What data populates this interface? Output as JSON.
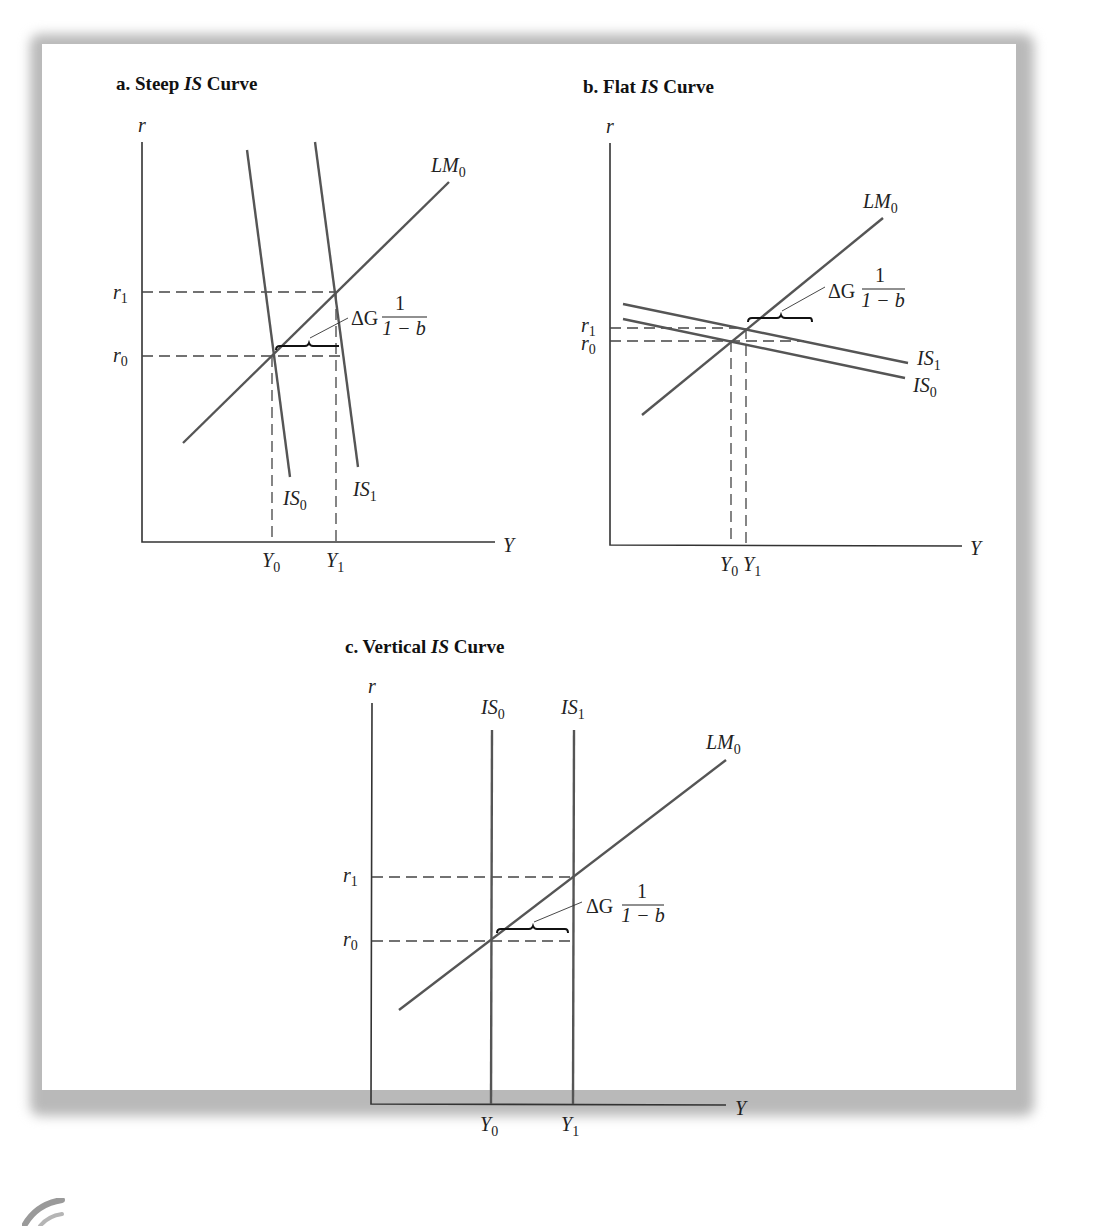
{
  "figure": {
    "panels": [
      {
        "id": "a",
        "title_prefix": "a.  Steep ",
        "title_italic": "IS",
        "title_suffix": " Curve",
        "y_axis_label": "r",
        "x_axis_label": "Y",
        "curves": {
          "lm0": "LM",
          "is0": "IS",
          "is1": "IS",
          "sub0": "0",
          "sub1": "1"
        },
        "ticks": {
          "r1": "r",
          "r0": "r",
          "y0": "Y",
          "y1": "Y",
          "sub0": "0",
          "sub1": "1"
        },
        "annotation": {
          "delta_g": "ΔG",
          "numerator": "1",
          "denominator": "1 − b"
        }
      },
      {
        "id": "b",
        "title_prefix": "b.  Flat ",
        "title_italic": "IS",
        "title_suffix": " Curve",
        "y_axis_label": "r",
        "x_axis_label": "Y",
        "curves": {
          "lm0": "LM",
          "is0": "IS",
          "is1": "IS",
          "sub0": "0",
          "sub1": "1"
        },
        "ticks": {
          "r1": "r",
          "r0": "r",
          "y0": "Y",
          "y1": "Y",
          "sub0": "0",
          "sub1": "1"
        },
        "annotation": {
          "delta_g": "ΔG",
          "numerator": "1",
          "denominator": "1 − b"
        }
      },
      {
        "id": "c",
        "title_prefix": "c.  Vertical ",
        "title_italic": "IS",
        "title_suffix": " Curve",
        "y_axis_label": "r",
        "x_axis_label": "Y",
        "curves": {
          "lm0": "LM",
          "is0": "IS",
          "is1": "IS",
          "sub0": "0",
          "sub1": "1"
        },
        "ticks": {
          "r1": "r",
          "r0": "r",
          "y0": "Y",
          "y1": "Y",
          "sub0": "0",
          "sub1": "1"
        },
        "annotation": {
          "delta_g": "ΔG",
          "numerator": "1",
          "denominator": "1 − b"
        }
      }
    ]
  },
  "colors": {
    "background": "#ffffff",
    "frame_shadow": "#b9b9b9",
    "curve": "#555555",
    "axis": "#333333",
    "text": "#222222"
  }
}
